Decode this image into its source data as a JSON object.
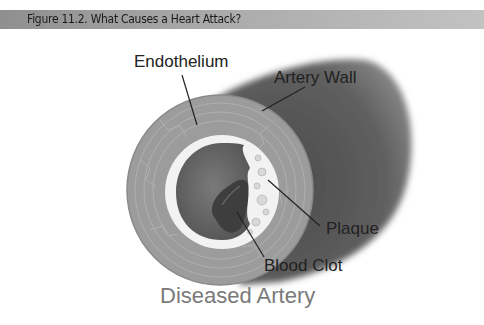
{
  "header": {
    "title": "Figure 11.2. What Causes a Heart Attack?"
  },
  "diagram": {
    "labels": {
      "endothelium": "Endothelium",
      "artery_wall": "Artery Wall",
      "plaque": "Plaque",
      "blood_clot": "Blood Clot"
    },
    "caption": "Diseased Artery"
  },
  "colors": {
    "header_bar": "#a8a8a8",
    "artery_outer": "#5e5e5e",
    "artery_wall_ring": "#9a9a9a",
    "endothelium": "#f2f2f2",
    "lumen": "#6a6a6a",
    "clot": "#444444",
    "caption": "#7a7a7a"
  }
}
